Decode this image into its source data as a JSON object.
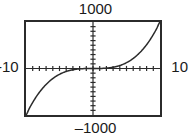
{
  "widget": {
    "name": "graphing-calculator-plot",
    "background_color": "#ffffff",
    "frame_color": "#2b2b2b",
    "curve_color": "#2b2b2b",
    "axis_color": "#2b2b2b"
  },
  "labels": {
    "y_max": "1000",
    "y_min": "–1000",
    "x_min": "-10",
    "x_max": "10"
  },
  "chart_data": {
    "type": "line",
    "title": "",
    "xlabel": "",
    "ylabel": "",
    "xlim": [
      -10,
      10
    ],
    "ylim": [
      -1000,
      1000
    ],
    "grid": false,
    "legend": null,
    "axes": {
      "x_axis_at_y": 0,
      "y_axis_at_x": 0,
      "x_tick_count": 20,
      "y_tick_count": 20,
      "x_tick_spacing": 1,
      "y_tick_spacing": 100,
      "ticks_drawn_on_axes": true
    },
    "series": [
      {
        "name": "y = x^3",
        "x": [
          -10,
          -9.5,
          -9,
          -8.5,
          -8,
          -7.5,
          -7,
          -6.5,
          -6,
          -5.5,
          -5,
          -4.5,
          -4,
          -3.5,
          -3,
          -2.5,
          -2,
          -1.5,
          -1,
          -0.5,
          0,
          0.5,
          1,
          1.5,
          2,
          2.5,
          3,
          3.5,
          4,
          4.5,
          5,
          5.5,
          6,
          6.5,
          7,
          7.5,
          8,
          8.5,
          9,
          9.5,
          10
        ],
        "values": [
          -1000,
          -857.4,
          -729,
          -614.1,
          -512,
          -421.9,
          -343,
          -274.6,
          -216,
          -166.4,
          -125,
          -91.1,
          -64,
          -42.9,
          -27,
          -15.6,
          -8,
          -3.4,
          -1,
          -0.1,
          0,
          0.1,
          1,
          3.4,
          8,
          15.6,
          27,
          42.9,
          64,
          91.1,
          125,
          166.4,
          216,
          274.6,
          343,
          421.9,
          512,
          614.1,
          729,
          857.4,
          1000
        ]
      }
    ],
    "annotations": []
  }
}
